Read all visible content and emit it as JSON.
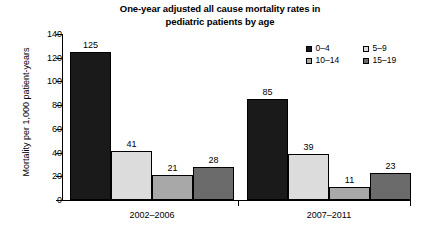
{
  "chart_data": {
    "type": "bar",
    "title": "One-year adjusted all cause mortality rates in pediatric patients by age",
    "title_line1": "One-year adjusted all cause mortality rates in",
    "title_line2": "pediatric patients by age",
    "xlabel": "",
    "ylabel": "Mortality per 1,000 patient-years",
    "categories": [
      "2002–2006",
      "2007–2011"
    ],
    "ylim": [
      0,
      140
    ],
    "yticks": [
      0,
      20,
      40,
      60,
      80,
      100,
      120,
      140
    ],
    "ytick_labels": [
      "0",
      "20",
      "40",
      "60",
      "80",
      "100",
      "120",
      "140"
    ],
    "grid": false,
    "legend_position": "upper-right",
    "series": [
      {
        "name": "0–4",
        "color": "#1a1a1a",
        "values": [
          125,
          85
        ]
      },
      {
        "name": "5–9",
        "color": "#dcdcdc",
        "values": [
          41,
          39
        ]
      },
      {
        "name": "10–14",
        "color": "#a8a8a8",
        "values": [
          21,
          11
        ]
      },
      {
        "name": "15–19",
        "color": "#6b6b6b",
        "values": [
          28,
          23
        ]
      }
    ],
    "data_labels": [
      [
        "125",
        "41",
        "21",
        "28"
      ],
      [
        "85",
        "39",
        "11",
        "23"
      ]
    ]
  },
  "legend": {
    "items": [
      {
        "label": "0–4",
        "color": "#1a1a1a"
      },
      {
        "label": "5–9",
        "color": "#dcdcdc"
      },
      {
        "label": "10–14",
        "color": "#a8a8a8"
      },
      {
        "label": "15–19",
        "color": "#6b6b6b"
      }
    ]
  }
}
